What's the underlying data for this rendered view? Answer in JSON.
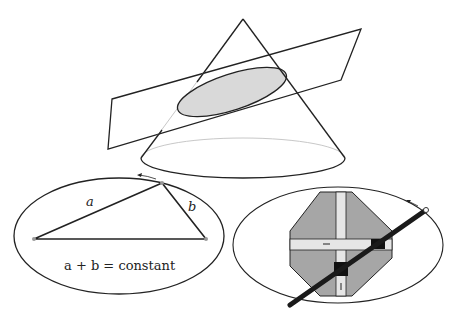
{
  "figure": {
    "cone_section": {
      "shape": "cone",
      "cut": "inclined plane",
      "section_fill": "#d9d9d9"
    },
    "string_construction": {
      "label_a": "a",
      "label_b": "b",
      "equation": "a + b = constant"
    },
    "trammel": {
      "shape": "octagon with cross slots",
      "octagon_fill": "#a6a6a6",
      "slot_fill": "#e6e6e6",
      "rod_color": "#1a1a1a"
    },
    "colors": {
      "stroke": "#222222",
      "faint": "#bdbdbd"
    }
  }
}
